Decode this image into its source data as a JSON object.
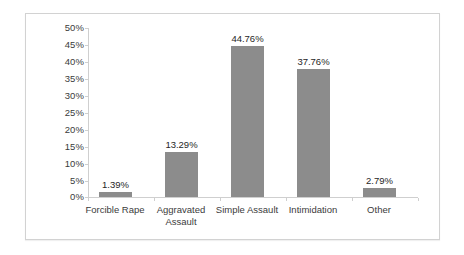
{
  "chart_data": {
    "type": "bar",
    "title": "",
    "xlabel": "",
    "ylabel": "",
    "categories": [
      "Forcible Rape",
      "Aggravated Assault",
      "Simple Assault",
      "Intimidation",
      "Other"
    ],
    "values": [
      1.39,
      13.29,
      44.76,
      37.76,
      2.79
    ],
    "value_labels": [
      "1.39%",
      "13.29%",
      "44.76%",
      "37.76%",
      "2.79%"
    ],
    "ylim": [
      0,
      50
    ],
    "y_tick_values": [
      50,
      45,
      40,
      35,
      30,
      25,
      20,
      15,
      10,
      5,
      0
    ],
    "y_tick_labels": [
      "50%",
      "45%",
      "40%",
      "35%",
      "30%",
      "25%",
      "20%",
      "15%",
      "10%",
      "5%",
      "0%"
    ],
    "grid": false,
    "legend": null,
    "series_color": "#8c8c8c",
    "axis_color": "#cfcfcf",
    "frame_color": "#d2d2d2"
  },
  "category_label_lines": [
    [
      "Forcible Rape"
    ],
    [
      "Aggravated",
      "Assault"
    ],
    [
      "Simple Assault"
    ],
    [
      "Intimidation"
    ],
    [
      "Other"
    ]
  ]
}
